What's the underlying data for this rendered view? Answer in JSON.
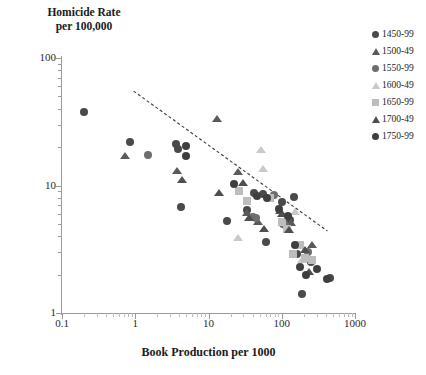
{
  "chart_data": {
    "type": "scatter",
    "title": "Homicide Rate per 100,000",
    "ylabel": "Homicide Rate\nper 100,000",
    "xlabel": "Book Production per 1000",
    "xscale": "log",
    "yscale": "log",
    "xlim": [
      0.1,
      1000
    ],
    "ylim": [
      1,
      100
    ],
    "xticks": [
      "0.1",
      "1",
      "10",
      "100",
      "1000"
    ],
    "yticks": [
      "1",
      "10",
      "100"
    ],
    "grid": false,
    "legend_position": "right",
    "trendline": {
      "style": "dashed",
      "color": "#3a3a3a",
      "x_start": 0.95,
      "y_start": 55.0,
      "x_end": 420.0,
      "y_end": 4.4
    },
    "series": [
      {
        "name": "1450-99",
        "marker": "circle",
        "color": "#4a4a4a",
        "points": [
          {
            "x": 0.2,
            "y": 38.0
          },
          {
            "x": 0.85,
            "y": 22.0
          },
          {
            "x": 3.6,
            "y": 21.0
          },
          {
            "x": 3.8,
            "y": 19.5
          },
          {
            "x": 4.2,
            "y": 6.8
          },
          {
            "x": 18.0,
            "y": 5.3
          },
          {
            "x": 33.0,
            "y": 6.4
          },
          {
            "x": 42.0,
            "y": 8.7
          },
          {
            "x": 55.0,
            "y": 8.6
          },
          {
            "x": 60.0,
            "y": 3.6
          },
          {
            "x": 100.0,
            "y": 7.4
          },
          {
            "x": 130.0,
            "y": 5.4
          },
          {
            "x": 145.0,
            "y": 8.2
          },
          {
            "x": 160.0,
            "y": 2.9
          },
          {
            "x": 190.0,
            "y": 1.4
          },
          {
            "x": 250.0,
            "y": 2.5
          },
          {
            "x": 460.0,
            "y": 1.9
          }
        ]
      },
      {
        "name": "1500-49",
        "marker": "triangle",
        "color": "#5a5a5a",
        "points": [
          {
            "x": 0.72,
            "y": 17.2
          },
          {
            "x": 3.7,
            "y": 13.0
          },
          {
            "x": 13.0,
            "y": 33.0
          },
          {
            "x": 25.0,
            "y": 12.8
          },
          {
            "x": 34.0,
            "y": 6.1
          },
          {
            "x": 48.0,
            "y": 5.2
          },
          {
            "x": 95.0,
            "y": 6.3
          },
          {
            "x": 115.0,
            "y": 5.0
          },
          {
            "x": 135.0,
            "y": 5.1
          },
          {
            "x": 260.0,
            "y": 3.4
          }
        ]
      },
      {
        "name": "1550-99",
        "marker": "circle",
        "color": "#6e6e6e",
        "points": [
          {
            "x": 1.5,
            "y": 17.5
          },
          {
            "x": 40.0,
            "y": 5.7
          },
          {
            "x": 44.0,
            "y": 5.6
          },
          {
            "x": 78.0,
            "y": 8.4
          },
          {
            "x": 105.0,
            "y": 5.0
          },
          {
            "x": 112.0,
            "y": 4.9
          },
          {
            "x": 230.0,
            "y": 3.0
          }
        ]
      },
      {
        "name": "1600-49",
        "marker": "triangle",
        "color": "#c9c9c9",
        "points": [
          {
            "x": 25.0,
            "y": 3.9
          },
          {
            "x": 52.0,
            "y": 19.0
          },
          {
            "x": 56.0,
            "y": 13.5
          },
          {
            "x": 150.0,
            "y": 6.2
          },
          {
            "x": 190.0,
            "y": 2.6
          }
        ]
      },
      {
        "name": "1650-99",
        "marker": "square",
        "color": "#bdbdbd",
        "points": [
          {
            "x": 26.0,
            "y": 9.0
          },
          {
            "x": 33.0,
            "y": 7.5
          },
          {
            "x": 70.0,
            "y": 8.0
          },
          {
            "x": 100.0,
            "y": 5.2
          },
          {
            "x": 118.0,
            "y": 4.6
          },
          {
            "x": 140.0,
            "y": 2.9
          },
          {
            "x": 175.0,
            "y": 3.4
          },
          {
            "x": 210.0,
            "y": 2.7
          },
          {
            "x": 255.0,
            "y": 2.6
          }
        ]
      },
      {
        "name": "1700-49",
        "marker": "triangle",
        "color": "#4f4f4f",
        "points": [
          {
            "x": 4.4,
            "y": 11.0
          },
          {
            "x": 14.0,
            "y": 8.8
          },
          {
            "x": 30.0,
            "y": 10.5
          },
          {
            "x": 36.0,
            "y": 5.6
          },
          {
            "x": 58.0,
            "y": 4.6
          },
          {
            "x": 100.0,
            "y": 6.0
          },
          {
            "x": 125.0,
            "y": 4.5
          },
          {
            "x": 205.0,
            "y": 3.1
          },
          {
            "x": 235.0,
            "y": 2.1
          }
        ]
      },
      {
        "name": "1750-99",
        "marker": "circle",
        "color": "#3f3f3f",
        "points": [
          {
            "x": 5.0,
            "y": 20.5
          },
          {
            "x": 4.9,
            "y": 17.0
          },
          {
            "x": 22.0,
            "y": 10.3
          },
          {
            "x": 46.0,
            "y": 8.3
          },
          {
            "x": 62.0,
            "y": 8.0
          },
          {
            "x": 92.0,
            "y": 6.6
          },
          {
            "x": 120.0,
            "y": 5.8
          },
          {
            "x": 150.0,
            "y": 3.4
          },
          {
            "x": 175.0,
            "y": 2.3
          },
          {
            "x": 215.0,
            "y": 2.0
          },
          {
            "x": 300.0,
            "y": 2.2
          },
          {
            "x": 420.0,
            "y": 1.85
          }
        ]
      }
    ]
  },
  "legend": {
    "items": [
      {
        "label": "1450-99",
        "marker": "circle",
        "color": "#4a4a4a"
      },
      {
        "label": "1500-49",
        "marker": "triangle",
        "color": "#5a5a5a"
      },
      {
        "label": "1550-99",
        "marker": "circle",
        "color": "#6e6e6e"
      },
      {
        "label": "1600-49",
        "marker": "triangle",
        "color": "#c9c9c9"
      },
      {
        "label": "1650-99",
        "marker": "square",
        "color": "#bdbdbd"
      },
      {
        "label": "1700-49",
        "marker": "triangle",
        "color": "#4f4f4f"
      },
      {
        "label": "1750-99",
        "marker": "circle",
        "color": "#3f3f3f"
      }
    ]
  }
}
